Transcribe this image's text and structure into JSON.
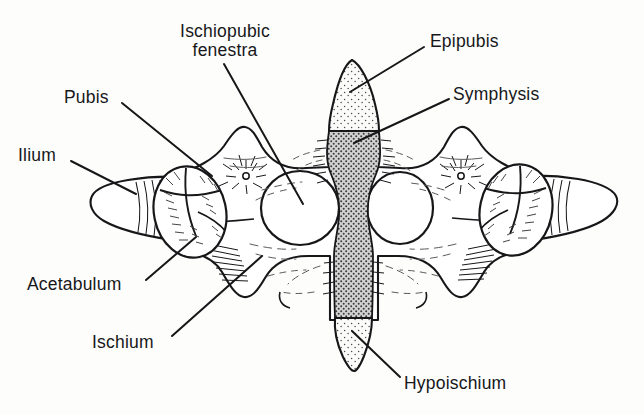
{
  "figure": {
    "title_text": "",
    "background_color": "#fdfdfb",
    "ink_color": "#17171a",
    "symphysis_fill": "#9a9a9a",
    "epipubis_fill": "#efefef",
    "fenestra_fill": "#ffffff"
  },
  "labels": [
    {
      "id": "ischiopubic-fenestra",
      "lines": [
        "Ischiopubic",
        "fenestra"
      ],
      "x": 160,
      "y": 22,
      "width": 130,
      "align": "center",
      "leader": {
        "x1": 224,
        "y1": 64,
        "x2": 303,
        "y2": 204
      }
    },
    {
      "id": "epipubis",
      "lines": [
        "Epipubis"
      ],
      "x": 430,
      "y": 32,
      "width": 90,
      "align": "left",
      "leader": {
        "x1": 424,
        "y1": 47,
        "x2": 350,
        "y2": 92
      }
    },
    {
      "id": "symphysis",
      "lines": [
        "Symphysis"
      ],
      "x": 453,
      "y": 85,
      "width": 100,
      "align": "left",
      "leader": {
        "x1": 449,
        "y1": 99,
        "x2": 354,
        "y2": 143
      }
    },
    {
      "id": "pubis",
      "lines": [
        "Pubis"
      ],
      "x": 64,
      "y": 88,
      "width": 55,
      "align": "left",
      "leader": {
        "x1": 122,
        "y1": 103,
        "x2": 212,
        "y2": 176
      }
    },
    {
      "id": "ilium",
      "lines": [
        "Ilium"
      ],
      "x": 18,
      "y": 146,
      "width": 50,
      "align": "left",
      "leader": {
        "x1": 71,
        "y1": 161,
        "x2": 136,
        "y2": 194
      }
    },
    {
      "id": "acetabulum",
      "lines": [
        "Acetabulum"
      ],
      "x": 27,
      "y": 275,
      "width": 115,
      "align": "left",
      "leader": {
        "x1": 146,
        "y1": 280,
        "x2": 196,
        "y2": 237
      }
    },
    {
      "id": "ischium",
      "lines": [
        "Ischium"
      ],
      "x": 92,
      "y": 333,
      "width": 78,
      "align": "left",
      "leader": {
        "x1": 172,
        "y1": 336,
        "x2": 262,
        "y2": 256
      }
    },
    {
      "id": "hypoischium",
      "lines": [
        "Hypoischium"
      ],
      "x": 404,
      "y": 374,
      "width": 125,
      "align": "left",
      "leader": {
        "x1": 400,
        "y1": 377,
        "x2": 352,
        "y2": 331
      }
    }
  ],
  "structures": {
    "left_ilium": "left lateral blunt rod process",
    "right_ilium": "right lateral blunt rod process",
    "left_acetabulum": "left hip socket oval with radiating hatching",
    "right_acetabulum": "right hip socket oval with radiating hatching",
    "left_fenestra": "left ischiopubic fenestra, large white oval",
    "right_fenestra": "right ischiopubic fenestra, large white oval",
    "epipubis": "median anterior triangular spike, light stipple",
    "symphysis": "median vertical dark stippled band",
    "hypoischium": "median posterior spike, light stipple"
  }
}
